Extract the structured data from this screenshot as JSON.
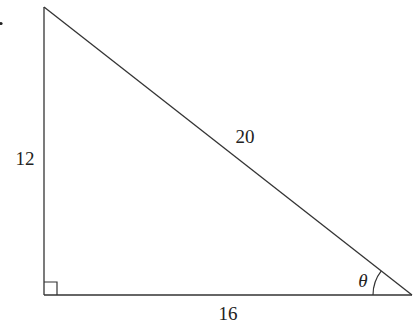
{
  "diagram": {
    "type": "right-triangle",
    "stroke_color": "#333333",
    "vertices": {
      "top": [
        44,
        7
      ],
      "right_angle": [
        44,
        295
      ],
      "right": [
        412,
        295
      ]
    },
    "labels": {
      "vertical_side": "12",
      "hypotenuse": "20",
      "horizontal_side": "16",
      "angle": "θ"
    },
    "right_angle_marker": true,
    "angle_arc_at": "right"
  }
}
